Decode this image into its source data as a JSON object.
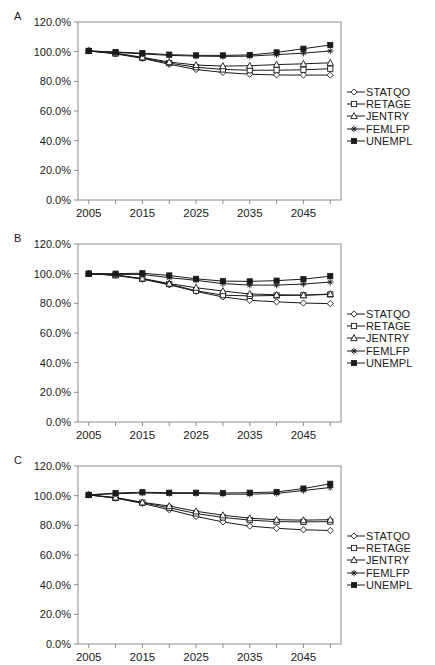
{
  "figure": {
    "panels": [
      {
        "letter": "A"
      },
      {
        "letter": "B"
      },
      {
        "letter": "C"
      }
    ],
    "caption": ""
  },
  "axes": {
    "y_ticks": [
      "0.0%",
      "20.0%",
      "40.0%",
      "60.0%",
      "80.0%",
      "100.0%",
      "120.0%"
    ],
    "x_ticks": [
      "2005",
      "2015",
      "2025",
      "2035",
      "2045"
    ],
    "ylabel": "",
    "xlabel": ""
  },
  "legend": {
    "position": "right",
    "entries": [
      {
        "label": "STATQO",
        "marker": "diamond-open"
      },
      {
        "label": "RETAGE",
        "marker": "square-open"
      },
      {
        "label": "JENTRY",
        "marker": "triangle-open"
      },
      {
        "label": "FEMLFP",
        "marker": "asterisk"
      },
      {
        "label": "UNEMPL",
        "marker": "square-filled"
      }
    ]
  },
  "chart_data": [
    {
      "type": "line",
      "title": "A",
      "xlabel": "",
      "ylabel": "",
      "xlim": [
        2003,
        2052
      ],
      "ylim": [
        0,
        120
      ],
      "ytick_values": [
        0,
        20,
        40,
        60,
        80,
        100,
        120
      ],
      "xtick_values": [
        2005,
        2015,
        2025,
        2035,
        2045
      ],
      "grid": false,
      "x": [
        2005,
        2010,
        2015,
        2020,
        2025,
        2030,
        2035,
        2040,
        2045,
        2050
      ],
      "series": [
        {
          "name": "STATQO",
          "marker": "diamond-open",
          "values": [
            100.5,
            98.5,
            95.5,
            91.5,
            88.0,
            86.0,
            84.8,
            84.3,
            84.2,
            84.2
          ]
        },
        {
          "name": "RETAGE",
          "marker": "square-open",
          "values": [
            100.5,
            98.8,
            95.8,
            92.3,
            89.5,
            88.0,
            87.5,
            87.5,
            87.8,
            88.5
          ]
        },
        {
          "name": "JENTRY",
          "marker": "triangle-open",
          "values": [
            100.5,
            99.0,
            96.2,
            93.0,
            91.0,
            90.3,
            90.5,
            91.3,
            91.8,
            92.5
          ]
        },
        {
          "name": "FEMLFP",
          "marker": "asterisk",
          "values": [
            100.5,
            99.5,
            98.5,
            97.5,
            97.0,
            96.8,
            97.0,
            98.0,
            99.0,
            100.5
          ]
        },
        {
          "name": "UNEMPL",
          "marker": "square-filled",
          "values": [
            100.5,
            99.8,
            99.0,
            98.0,
            97.5,
            97.5,
            97.8,
            99.5,
            102.0,
            104.5
          ]
        }
      ]
    },
    {
      "type": "line",
      "title": "B",
      "xlabel": "",
      "ylabel": "",
      "xlim": [
        2003,
        2052
      ],
      "ylim": [
        0,
        120
      ],
      "ytick_values": [
        0,
        20,
        40,
        60,
        80,
        100,
        120
      ],
      "xtick_values": [
        2005,
        2015,
        2025,
        2035,
        2045
      ],
      "grid": false,
      "x": [
        2005,
        2010,
        2015,
        2020,
        2025,
        2030,
        2035,
        2040,
        2045,
        2050
      ],
      "series": [
        {
          "name": "STATQO",
          "marker": "diamond-open",
          "values": [
            100.0,
            98.8,
            96.3,
            92.5,
            88.0,
            84.3,
            82.0,
            81.0,
            80.2,
            79.8
          ]
        },
        {
          "name": "RETAGE",
          "marker": "square-open",
          "values": [
            100.0,
            99.0,
            96.5,
            93.0,
            88.5,
            85.5,
            85.0,
            85.3,
            85.5,
            86.0
          ]
        },
        {
          "name": "JENTRY",
          "marker": "triangle-open",
          "values": [
            100.0,
            99.0,
            96.8,
            93.3,
            90.5,
            88.3,
            86.3,
            85.8,
            85.5,
            86.3
          ]
        },
        {
          "name": "FEMLFP",
          "marker": "asterisk",
          "values": [
            100.0,
            99.5,
            99.5,
            97.3,
            95.5,
            93.3,
            92.3,
            92.3,
            93.0,
            94.3
          ]
        },
        {
          "name": "UNEMPL",
          "marker": "square-filled",
          "values": [
            100.0,
            100.0,
            100.3,
            98.8,
            96.5,
            95.0,
            94.8,
            95.3,
            96.3,
            98.3
          ]
        }
      ]
    },
    {
      "type": "line",
      "title": "C",
      "xlabel": "",
      "ylabel": "",
      "xlim": [
        2003,
        2052
      ],
      "ylim": [
        0,
        120
      ],
      "ytick_values": [
        0,
        20,
        40,
        60,
        80,
        100,
        120
      ],
      "xtick_values": [
        2005,
        2015,
        2025,
        2035,
        2045
      ],
      "grid": false,
      "x": [
        2005,
        2010,
        2015,
        2020,
        2025,
        2030,
        2035,
        2040,
        2045,
        2050
      ],
      "series": [
        {
          "name": "STATQO",
          "marker": "diamond-open",
          "values": [
            100.5,
            98.3,
            94.8,
            90.5,
            86.0,
            82.3,
            79.5,
            78.0,
            77.0,
            76.5
          ]
        },
        {
          "name": "RETAGE",
          "marker": "square-open",
          "values": [
            100.5,
            98.5,
            95.3,
            91.8,
            88.0,
            85.3,
            83.5,
            82.5,
            82.3,
            82.5
          ]
        },
        {
          "name": "JENTRY",
          "marker": "triangle-open",
          "values": [
            100.5,
            98.8,
            95.5,
            93.0,
            89.5,
            86.8,
            84.8,
            83.8,
            83.5,
            83.8
          ]
        },
        {
          "name": "FEMLFP",
          "marker": "asterisk",
          "values": [
            100.5,
            101.3,
            101.8,
            101.5,
            101.5,
            101.0,
            101.0,
            101.5,
            103.5,
            105.5
          ]
        },
        {
          "name": "UNEMPL",
          "marker": "square-filled",
          "values": [
            100.5,
            101.8,
            102.3,
            102.0,
            102.0,
            101.8,
            102.0,
            102.5,
            104.8,
            108.0
          ]
        }
      ]
    }
  ]
}
